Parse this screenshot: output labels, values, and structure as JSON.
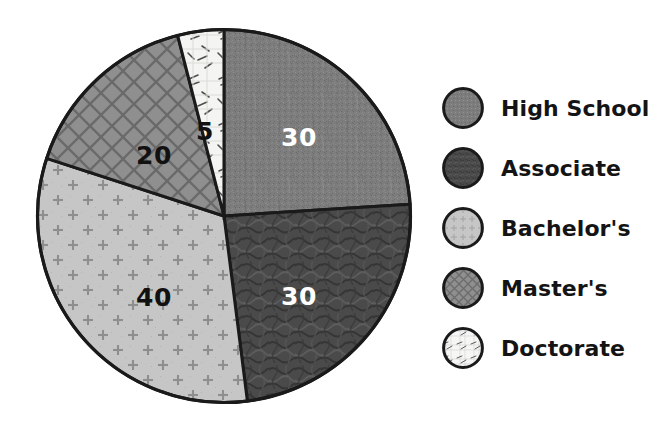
{
  "chart_data": {
    "type": "pie",
    "title": "",
    "subtitle": "",
    "xlabel": "",
    "ylabel": "",
    "categories": [
      "High School",
      "Associate",
      "Bachelor's",
      "Master's",
      "Doctorate"
    ],
    "values": [
      30,
      30,
      40,
      20,
      5
    ],
    "total": 125,
    "value_labels": [
      "30",
      "30",
      "40",
      "20",
      "5"
    ],
    "label_colors": [
      "#ffffff",
      "#ffffff",
      "#111111",
      "#111111",
      "#111111"
    ],
    "legend_position": "right",
    "grid": false,
    "start_angle_deg": 0,
    "direction": "clockwise",
    "slices": [
      {
        "name": "High School",
        "value": 30,
        "value_label": "30",
        "fill": "#7d7d7d",
        "pattern": "speckle",
        "start_deg": 0,
        "end_deg": 86.4,
        "label_x": 299,
        "label_y": 137,
        "label_tone": "light"
      },
      {
        "name": "Associate",
        "value": 30,
        "value_label": "30",
        "fill": "#4a4a4a",
        "pattern": "squiggle",
        "start_deg": 86.4,
        "end_deg": 172.8,
        "label_x": 299,
        "label_y": 296,
        "label_tone": "light"
      },
      {
        "name": "Bachelor's",
        "value": 40,
        "value_label": "40",
        "fill": "#c6c6c6",
        "pattern": "plus",
        "start_deg": 172.8,
        "end_deg": 288.0,
        "label_x": 154,
        "label_y": 297,
        "label_tone": "dark"
      },
      {
        "name": "Master's",
        "value": 20,
        "value_label": "20",
        "fill": "#8f8f8f",
        "pattern": "crosshatch",
        "start_deg": 288.0,
        "end_deg": 345.6,
        "label_x": 154,
        "label_y": 155,
        "label_tone": "dark"
      },
      {
        "name": "Doctorate",
        "value": 5,
        "value_label": "5",
        "fill": "#f4f4f2",
        "pattern": "scribble",
        "start_deg": 345.6,
        "end_deg": 360.0,
        "label_x": 205,
        "label_y": 131,
        "label_tone": "dark"
      }
    ],
    "colors": {
      "high_school": "#7d7d7d",
      "associate": "#4a4a4a",
      "bachelors": "#c6c6c6",
      "masters": "#8f8f8f",
      "doctorate": "#f4f4f2",
      "outline": "#1a1a1a",
      "background": "#ffffff",
      "legend_text": "#141414"
    }
  },
  "legend": {
    "items": [
      {
        "label": "High School",
        "swatch": "high-school-swatch"
      },
      {
        "label": "Associate",
        "swatch": "associate-swatch"
      },
      {
        "label": "Bachelor's",
        "swatch": "bachelors-swatch"
      },
      {
        "label": "Master's",
        "swatch": "masters-swatch"
      },
      {
        "label": "Doctorate",
        "swatch": "doctorate-swatch"
      }
    ]
  }
}
